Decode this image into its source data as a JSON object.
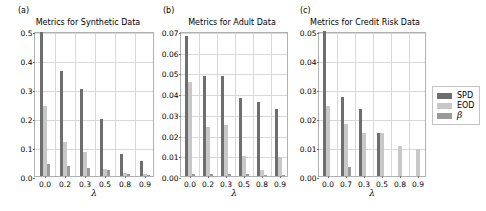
{
  "figure": {
    "panel_tags": [
      "(a)",
      "(b)",
      "(c)"
    ],
    "xlabel": "λ",
    "legend": {
      "entries": [
        {
          "label": "SPD",
          "color": "#6e6e6e"
        },
        {
          "label": "EOD",
          "color": "#c8c8c8"
        },
        {
          "label": "β",
          "color": "#9a9a9a"
        }
      ]
    }
  },
  "chart_data": [
    {
      "type": "bar",
      "panel": "(a)",
      "title": "Metrics for Synthetic Data",
      "xlabel": "λ",
      "ylabel": "",
      "categories": [
        "0.0",
        "0.2",
        "0.3",
        "0.5",
        "0.8",
        "0.9"
      ],
      "ylim": [
        0.0,
        0.5
      ],
      "yticks": [
        "0.0",
        "0.1",
        "0.2",
        "0.3",
        "0.4",
        "0.5"
      ],
      "ytick_values": [
        0.0,
        0.1,
        0.2,
        0.3,
        0.4,
        0.5
      ],
      "grid": true,
      "legend_position": "outside-right",
      "series": [
        {
          "name": "SPD",
          "color": "#6e6e6e",
          "values": [
            0.498,
            0.362,
            0.301,
            0.195,
            0.077,
            0.052
          ]
        },
        {
          "name": "EOD",
          "color": "#c8c8c8",
          "values": [
            0.24,
            0.118,
            0.084,
            0.023,
            0.012,
            0.008
          ]
        },
        {
          "name": "β",
          "color": "#9a9a9a",
          "values": [
            0.04,
            0.034,
            0.027,
            0.02,
            0.007,
            0.005
          ]
        }
      ]
    },
    {
      "type": "bar",
      "panel": "(b)",
      "title": "Metrics for Adult Data",
      "xlabel": "λ",
      "ylabel": "",
      "categories": [
        "0.0",
        "0.2",
        "0.3",
        "0.5",
        "0.8",
        "0.9"
      ],
      "ylim": [
        0.0,
        0.07
      ],
      "yticks": [
        "0.00",
        "0.01",
        "0.02",
        "0.03",
        "0.04",
        "0.05",
        "0.06",
        "0.07"
      ],
      "ytick_values": [
        0.0,
        0.01,
        0.02,
        0.03,
        0.04,
        0.05,
        0.06,
        0.07
      ],
      "grid": true,
      "legend_position": "outside-right",
      "series": [
        {
          "name": "SPD",
          "color": "#6e6e6e",
          "values": [
            0.0675,
            0.0485,
            0.0485,
            0.0375,
            0.0358,
            0.0322
          ]
        },
        {
          "name": "EOD",
          "color": "#c8c8c8",
          "values": [
            0.0455,
            0.0235,
            0.0245,
            0.0095,
            0.003,
            0.0093
          ]
        },
        {
          "name": "β",
          "color": "#9a9a9a",
          "values": [
            0.0012,
            0.001,
            0.001,
            0.0008,
            0.0005,
            0.0005
          ]
        }
      ]
    },
    {
      "type": "bar",
      "panel": "(c)",
      "title": "Metrics for Credit Risk Data",
      "xlabel": "λ",
      "ylabel": "",
      "categories": [
        "0.0",
        "0.7",
        "0.3",
        "0.5",
        "0.8",
        "0.9"
      ],
      "ylim": [
        0.0,
        0.05
      ],
      "yticks": [
        "0.00",
        "0.01",
        "0.02",
        "0.03",
        "0.04",
        "0.05"
      ],
      "ytick_values": [
        0.0,
        0.01,
        0.02,
        0.03,
        0.04,
        0.05
      ],
      "grid": true,
      "legend_position": "outside-right",
      "series": [
        {
          "name": "SPD",
          "color": "#6e6e6e",
          "values": [
            0.05,
            0.0272,
            0.023,
            0.0148,
            0.0,
            0.0
          ]
        },
        {
          "name": "EOD",
          "color": "#c8c8c8",
          "values": [
            0.024,
            0.0178,
            0.0148,
            0.0148,
            0.0105,
            0.0092
          ]
        },
        {
          "name": "β",
          "color": "#9a9a9a",
          "values": [
            0.0,
            0.0032,
            0.0,
            0.0,
            0.0,
            0.0
          ]
        }
      ]
    }
  ]
}
